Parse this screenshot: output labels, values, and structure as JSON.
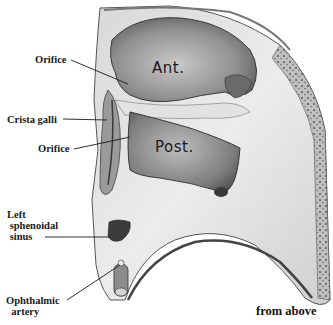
{
  "figure": {
    "caption": "from above",
    "region_labels": {
      "anterior": "Ant.",
      "posterior": "Post."
    },
    "callouts": [
      {
        "id": "orifice-upper",
        "text": "Orifice"
      },
      {
        "id": "crista-galli",
        "text": "Crista galli"
      },
      {
        "id": "orifice-lower",
        "text": "Orifice"
      },
      {
        "id": "left-sphenoidal-sinus",
        "text": "Left\n sphenoidal\n sinus"
      },
      {
        "id": "ophthalmic-artery",
        "text": "Ophthalmic\n  artery"
      }
    ]
  },
  "colors": {
    "background": "#ffffff",
    "bone_light": "#e6e6e6",
    "bone_mid": "#a8a8a8",
    "cavity_dark": "#5a5a5a",
    "ink": "#1a1a1a"
  }
}
